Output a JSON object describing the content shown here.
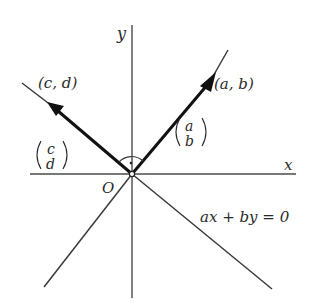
{
  "diagram": {
    "axes": {
      "x_label": "x",
      "y_label": "y",
      "origin_label": "O"
    },
    "vectors": [
      {
        "id": "ab",
        "point_label": "(a, b)",
        "column_top": "a",
        "column_bottom": "b",
        "direction": "upper-right"
      },
      {
        "id": "cd",
        "point_label": "(c, d)",
        "column_top": "c",
        "column_bottom": "d",
        "direction": "upper-left"
      }
    ],
    "line_equation": "ax + by = 0",
    "right_angle_marker": true,
    "colors": {
      "ink": "#111111",
      "axis": "#4a4a4a",
      "background": "#ffffff"
    }
  }
}
